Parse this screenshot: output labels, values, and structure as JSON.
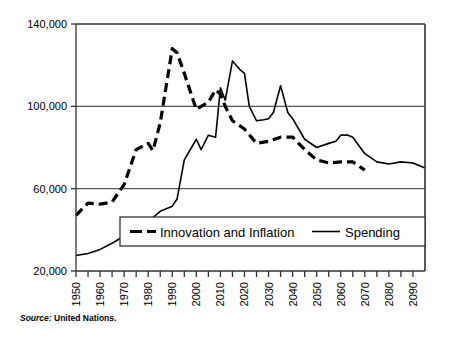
{
  "source": {
    "lead": "Source:",
    "body": "United Nations."
  },
  "legend": {
    "items": [
      {
        "label": "Innovation and Inflation",
        "style": "dashed"
      },
      {
        "label": "Spending",
        "style": "solid"
      }
    ]
  },
  "chart_data": {
    "type": "line",
    "title": "",
    "xlabel": "",
    "ylabel": "",
    "xlim": [
      1950,
      2095
    ],
    "ylim": [
      20000,
      140000
    ],
    "yticks": [
      20000,
      60000,
      100000,
      140000
    ],
    "ytick_labels": [
      "20,000",
      "60,000",
      "100,000",
      "140,000"
    ],
    "xticks": [
      1950,
      1955,
      1960,
      1965,
      1970,
      1975,
      1980,
      1985,
      1990,
      1995,
      2000,
      2005,
      2010,
      2015,
      2020,
      2025,
      2030,
      2035,
      2040,
      2045,
      2050,
      2055,
      2060,
      2065,
      2070,
      2075,
      2080,
      2085,
      2090
    ],
    "xtick_labels": [
      "1950",
      "1960",
      "1970",
      "1980",
      "1990",
      "2000",
      "2010",
      "2020",
      "2030",
      "2040",
      "2050",
      "2060",
      "2070",
      "2080",
      "2090"
    ],
    "xtick_label_values": [
      1950,
      1960,
      1970,
      1980,
      1990,
      2000,
      2010,
      2020,
      2030,
      2040,
      2050,
      2060,
      2070,
      2080,
      2090
    ],
    "xtick_label_rotation": -90,
    "grid": "horizontal",
    "gridlines": [
      60000,
      100000
    ],
    "series": [
      {
        "name": "Innovation and Inflation",
        "style": "dashed",
        "color": "#000000",
        "width": 3.2,
        "x": [
          1950,
          1955,
          1960,
          1965,
          1970,
          1975,
          1980,
          1982,
          1985,
          1990,
          1992,
          1995,
          2000,
          2002,
          2005,
          2008,
          2010,
          2012,
          2015,
          2020,
          2025,
          2030,
          2035,
          2040,
          2045,
          2050,
          2055,
          2060,
          2065,
          2070
        ],
        "y": [
          47000,
          53000,
          52500,
          53500,
          62000,
          79000,
          82000,
          78500,
          92000,
          128000,
          126000,
          116000,
          98500,
          100000,
          102000,
          108000,
          106000,
          100000,
          93000,
          89000,
          82000,
          83000,
          85000,
          85000,
          79000,
          74000,
          72500,
          73000,
          73000,
          69000
        ]
      },
      {
        "name": "Spending",
        "style": "solid",
        "color": "#000000",
        "width": 1.6,
        "x": [
          1950,
          1955,
          1960,
          1965,
          1970,
          1975,
          1980,
          1985,
          1990,
          1992,
          1995,
          2000,
          2002,
          2005,
          2008,
          2010,
          2012,
          2015,
          2018,
          2020,
          2022,
          2025,
          2028,
          2030,
          2032,
          2035,
          2038,
          2040,
          2045,
          2050,
          2055,
          2058,
          2060,
          2063,
          2065,
          2070,
          2075,
          2080,
          2085,
          2090,
          2095
        ],
        "y": [
          27500,
          28500,
          30500,
          33500,
          37000,
          41000,
          44000,
          49000,
          51500,
          55000,
          74000,
          84000,
          79000,
          86000,
          85000,
          109000,
          103000,
          122000,
          118000,
          116000,
          100000,
          93000,
          93500,
          94000,
          97000,
          110000,
          97000,
          94000,
          84000,
          80000,
          82000,
          83000,
          86000,
          86000,
          85000,
          77000,
          73000,
          72000,
          73000,
          72500,
          70000
        ]
      }
    ]
  }
}
